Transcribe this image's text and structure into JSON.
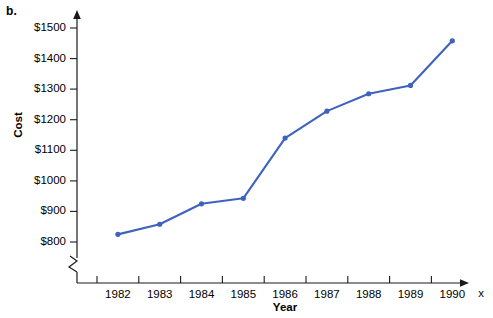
{
  "figure": {
    "part_label": "b.",
    "accent_color": "#3f63bd",
    "axis_color": "#1a1a1a",
    "background": "#ffffff"
  },
  "chart_data": {
    "type": "line",
    "title": "",
    "xlabel": "Year",
    "ylabel": "Cost",
    "x_variable_label": "x",
    "categories": [
      1982,
      1983,
      1984,
      1985,
      1986,
      1987,
      1988,
      1989,
      1990
    ],
    "x": [
      1982,
      1983,
      1984,
      1985,
      1986,
      1987,
      1988,
      1989,
      1990
    ],
    "values": [
      825,
      858,
      925,
      943,
      1140,
      1228,
      1285,
      1312,
      1458
    ],
    "series": [
      {
        "name": "Cost",
        "values": [
          825,
          858,
          925,
          943,
          1140,
          1228,
          1285,
          1312,
          1458
        ]
      }
    ],
    "x_tick_labels": [
      "1982",
      "1983",
      "1984",
      "1985",
      "1986",
      "1987",
      "1988",
      "1989",
      "1990"
    ],
    "y_tick_labels": [
      "$800",
      "$900",
      "$1000",
      "$1100",
      "$1200",
      "$1300",
      "$1400",
      "$1500"
    ],
    "y_tick_values": [
      800,
      900,
      1000,
      1100,
      1200,
      1300,
      1400,
      1500
    ],
    "ylim": [
      800,
      1500
    ],
    "xlim": [
      1981.5,
      1990.5
    ],
    "grid": false,
    "legend": false,
    "y_axis_break": true,
    "marker": "circle",
    "line_color": "#3f63bd"
  }
}
